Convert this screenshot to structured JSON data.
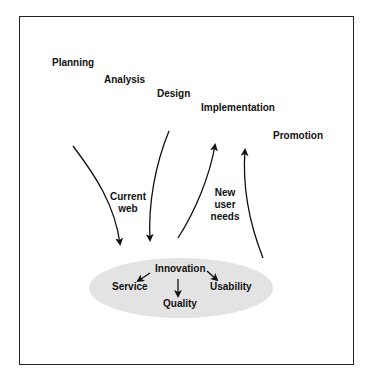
{
  "diagram": {
    "phases": [
      {
        "label": "Planning"
      },
      {
        "label": "Analysis"
      },
      {
        "label": "Design"
      },
      {
        "label": "Implementation"
      },
      {
        "label": "Promotion"
      }
    ],
    "flow_labels": {
      "current_web": [
        "Current",
        "web"
      ],
      "new_user_needs": [
        "New",
        "user",
        "needs"
      ]
    },
    "core": {
      "center": "Innovation",
      "left": "Service",
      "bottom": "Quality",
      "right": "Usability"
    },
    "colors": {
      "frame": "#222222",
      "ellipse_fill": "#e3e3e3",
      "text": "#111111",
      "arrow": "#111111"
    }
  }
}
